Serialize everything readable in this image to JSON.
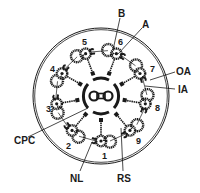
{
  "figure": {
    "labels": {
      "B": "B",
      "A": "A",
      "OA": "OA",
      "IA": "IA",
      "CPC": "CPC",
      "NL": "NL",
      "RS": "RS"
    },
    "doublet_numbers": [
      "1",
      "2",
      "3",
      "4",
      "5",
      "6",
      "7",
      "8",
      "9"
    ],
    "colors": {
      "ink": "#1a1a1a",
      "background": "#ffffff"
    }
  }
}
